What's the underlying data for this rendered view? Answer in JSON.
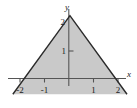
{
  "figure": {
    "type": "math-graph",
    "background_color": "#ffffff",
    "width": 137,
    "height": 108
  },
  "axes": {
    "x_label": "x",
    "y_label": "y",
    "axis_color": "#555555",
    "x_ticks": [
      {
        "value": -2,
        "label": "-2"
      },
      {
        "value": -1,
        "label": "-1"
      },
      {
        "value": 1,
        "label": "1"
      },
      {
        "value": 2,
        "label": "2"
      }
    ],
    "y_ticks": [
      {
        "value": 1,
        "label": "1"
      },
      {
        "value": 2,
        "label": "2"
      }
    ]
  },
  "chart_data": {
    "type": "area",
    "title": "",
    "xlabel": "x",
    "ylabel": "y",
    "xlim": [
      -2.45,
      2.35
    ],
    "ylim": [
      -0.35,
      2.4
    ],
    "grid": false,
    "legend": "none",
    "series": [
      {
        "name": "triangle region",
        "description": "Shaded triangular region bounded by y = 2 + x on [-2, 0], y = 2 - x on [0, 2], and the x-axis",
        "fill_color": "#c9c9c9",
        "edge_color": "#2b2b2b",
        "vertices": [
          {
            "x": -2,
            "y": 0
          },
          {
            "x": 0,
            "y": 2
          },
          {
            "x": 2,
            "y": 0
          }
        ]
      }
    ],
    "annotations": []
  }
}
